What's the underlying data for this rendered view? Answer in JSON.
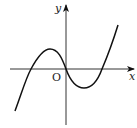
{
  "figure": {
    "type": "function-graph",
    "axes": {
      "x_label": "x",
      "y_label": "y",
      "origin_label": "O"
    },
    "curve": {
      "shape": "cubic",
      "x_intercepts": [
        "negative",
        "origin",
        "positive"
      ],
      "local_max": "left of y-axis, above x-axis",
      "local_min": "right of y-axis, below x-axis"
    },
    "colors": {
      "stroke": "#111111",
      "background": "#ffffff"
    }
  }
}
